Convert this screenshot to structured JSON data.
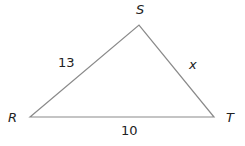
{
  "diagram": {
    "type": "triangle",
    "vertices": [
      {
        "name": "S",
        "label": "S"
      },
      {
        "name": "R",
        "label": "R"
      },
      {
        "name": "T",
        "label": "T"
      }
    ],
    "sides": [
      {
        "between": "RS",
        "label": "13"
      },
      {
        "between": "ST",
        "label": "x"
      },
      {
        "between": "RT",
        "label": "10"
      }
    ],
    "line_color": "#888888"
  }
}
